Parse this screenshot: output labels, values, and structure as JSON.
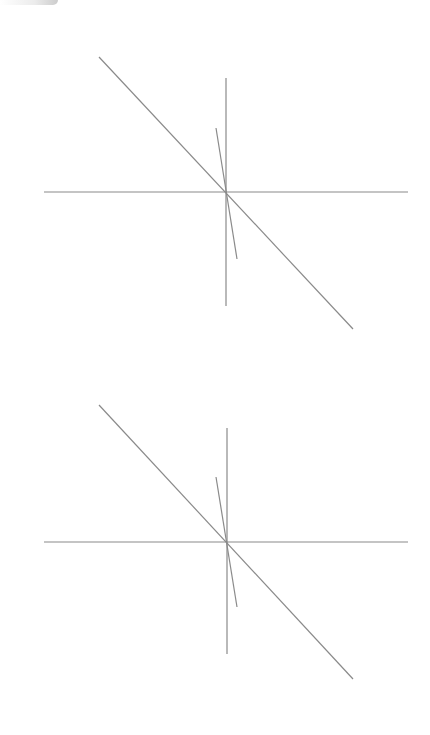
{
  "canvas": {
    "width": 430,
    "height": 735,
    "background": "#ffffff"
  },
  "style": {
    "line_color": "#8a8a8a",
    "line_width": 1.2
  },
  "diagrams": [
    {
      "name": "top-diagram",
      "lines": {
        "horizontal": {
          "x1": 44,
          "y1": 192,
          "x2": 408,
          "y2": 192
        },
        "vertical": {
          "x1": 226,
          "y1": 78,
          "x2": 226,
          "y2": 306
        },
        "diagonal": {
          "x1": 99,
          "y1": 57,
          "x2": 353,
          "y2": 329
        },
        "steep": {
          "x1": 216,
          "y1": 128,
          "x2": 237,
          "y2": 259
        }
      }
    },
    {
      "name": "bottom-diagram",
      "lines": {
        "horizontal": {
          "x1": 44,
          "y1": 542,
          "x2": 408,
          "y2": 542
        },
        "vertical": {
          "x1": 227,
          "y1": 428,
          "x2": 227,
          "y2": 654
        },
        "diagonal": {
          "x1": 99,
          "y1": 405,
          "x2": 353,
          "y2": 679
        },
        "steep": {
          "x1": 216,
          "y1": 477,
          "x2": 237,
          "y2": 607
        }
      }
    }
  ]
}
